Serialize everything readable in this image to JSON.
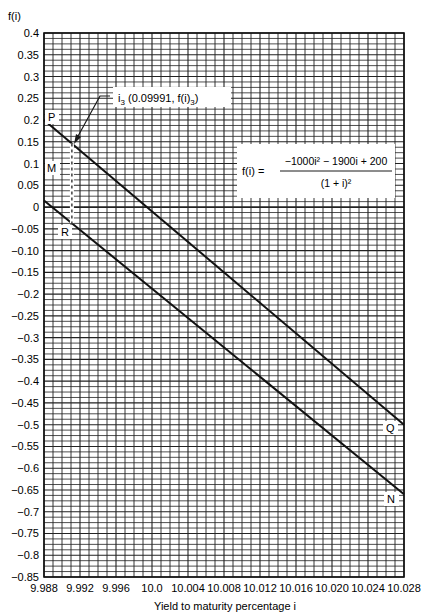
{
  "chart_data": {
    "type": "line",
    "title": "",
    "ylabel": "f(i)",
    "xlabel": "Yield to maturity percentage i",
    "xlim": [
      9.988,
      10.028
    ],
    "ylim": [
      -0.85,
      0.4
    ],
    "grid": true,
    "x_ticks": [
      "9.988",
      "9.992",
      "9.996",
      "10.0",
      "10.004",
      "10.008",
      "10.012",
      "10.016",
      "10.020",
      "10.024",
      "10.028"
    ],
    "y_ticks": [
      "0.4",
      "0.35",
      "0.3",
      "0.25",
      "0.2",
      "0.15",
      "0.1",
      "0.05",
      "0",
      "−0.05",
      "−0.10",
      "−0.15",
      "−0.2",
      "−0.25",
      "−0.3",
      "−0.35",
      "−0.4",
      "−0.45",
      "−0.5",
      "−0.55",
      "−0.6",
      "−0.65",
      "−0.7",
      "−0.75",
      "−0.8",
      "−0.85"
    ],
    "series": [
      {
        "name": "PQ",
        "start_label": "P",
        "end_label": "Q",
        "x": [
          9.988,
          10.028
        ],
        "y": [
          0.2,
          -0.5
        ]
      },
      {
        "name": "MN",
        "start_label": "M",
        "end_label": "N",
        "x": [
          9.988,
          10.028
        ],
        "y": [
          0.015,
          -0.66
        ]
      }
    ],
    "annotations": [
      {
        "type": "dashed-vertical",
        "x": 9.9911,
        "y_from": 0.146,
        "y_to": -0.037,
        "label": "R",
        "label_y": -0.05
      },
      {
        "type": "arrow-label",
        "text_main": "i",
        "text_sub": "3",
        "text_rest": " (0.09991, f(i)",
        "text_sub2": "3",
        "text_end": ")",
        "point_x": 9.9911,
        "point_y": 0.146
      },
      {
        "type": "formula",
        "lhs": "f(i) =",
        "numerator": "−1000i² − 1900i + 200",
        "denominator": "(1 + i)²"
      }
    ]
  },
  "labels": {
    "ylabel": "f(i)",
    "xlabel": "Yield to maturity percentage i",
    "point_P": "P",
    "point_Q": "Q",
    "point_M": "M",
    "point_N": "N",
    "point_R": "R",
    "i3_label": "i",
    "i3_sub": "3",
    "i3_rest": " (0.09991, f(i)",
    "i3_sub2": "3",
    "i3_end": ")",
    "formula_lhs": "f(i) =",
    "formula_num": "−1000i² − 1900i + 200",
    "formula_den": "(1 + i)²"
  }
}
